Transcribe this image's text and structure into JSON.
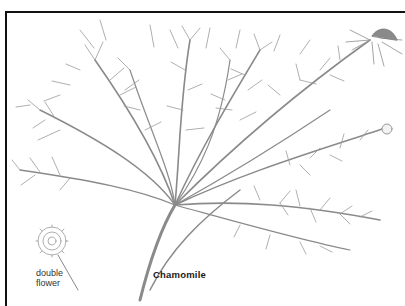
{
  "illustration": {
    "subject": "Chamomile",
    "caption": "Chamomile",
    "callouts": [
      {
        "line1": "double",
        "line2": "flower"
      }
    ],
    "colors": {
      "frame": "#111111",
      "stems": "#7a7a7a",
      "flower_center": "#8a8a8a",
      "background": "#ffffff"
    }
  }
}
